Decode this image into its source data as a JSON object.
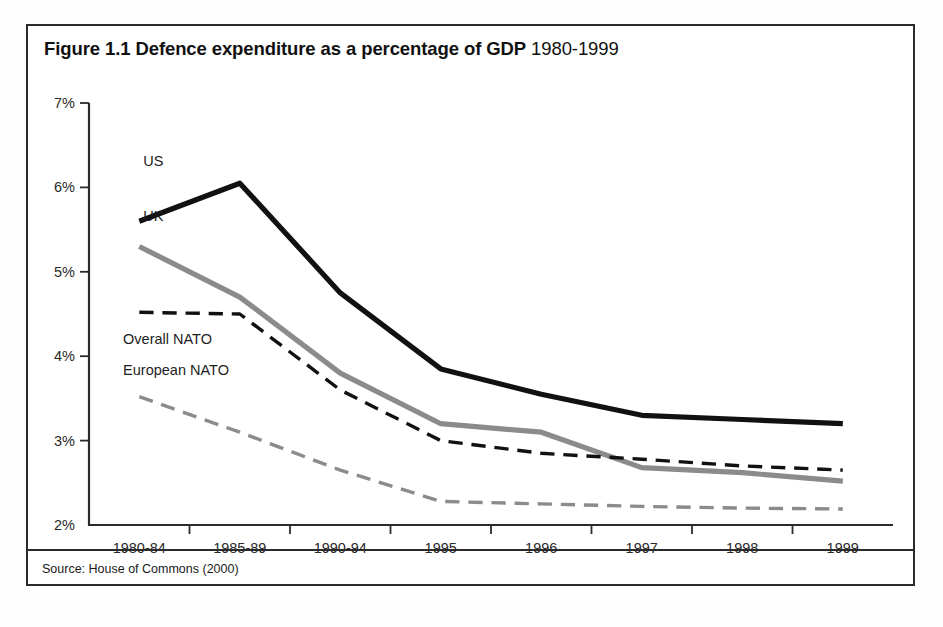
{
  "figure": {
    "title_bold": "Figure 1.1 Defence expenditure as a percentage of GDP",
    "title_regular": "1980-1999",
    "source": "Source: House of Commons (2000)"
  },
  "chart_data": {
    "type": "line",
    "title": "Figure 1.1 Defence expenditure as a percentage of GDP 1980-1999",
    "xlabel": "",
    "ylabel": "",
    "ylim": [
      2,
      7
    ],
    "ytick_values": [
      2,
      3,
      4,
      5,
      6,
      7
    ],
    "ytick_labels": [
      "2%",
      "3%",
      "4%",
      "5%",
      "6%",
      "7%"
    ],
    "grid": false,
    "legend_position": "inline-labels",
    "categories": [
      "1980-84",
      "1985-89",
      "1990-94",
      "1995",
      "1996",
      "1997",
      "1998",
      "1999"
    ],
    "series": [
      {
        "name": "US",
        "values": [
          5.6,
          6.05,
          4.75,
          3.85,
          3.55,
          3.3,
          3.25,
          3.2
        ],
        "color": "#111111",
        "style": "solid",
        "width": 5.2,
        "label_x": 1980.4,
        "label_y": 6.25
      },
      {
        "name": "UK",
        "values": [
          5.3,
          4.7,
          3.8,
          3.2,
          3.1,
          2.68,
          2.62,
          2.52
        ],
        "color": "#8b8b8b",
        "style": "solid",
        "width": 5.2,
        "label_x": 1980.4,
        "label_y": 5.6
      },
      {
        "name": "Overall NATO",
        "values": [
          4.52,
          4.5,
          3.6,
          3.0,
          2.85,
          2.78,
          2.7,
          2.65
        ],
        "color": "#111111",
        "style": "dashed",
        "width": 3.4,
        "label_x": 1980.2,
        "label_y": 4.15
      },
      {
        "name": "European NATO",
        "values": [
          3.52,
          3.1,
          2.65,
          2.28,
          2.25,
          2.22,
          2.2,
          2.19
        ],
        "color": "#8b8b8b",
        "style": "dashed",
        "width": 3.4,
        "label_x": 1980.2,
        "label_y": 3.78
      }
    ]
  },
  "colors": {
    "frame": "#2b2b2b",
    "axis": "#2b2b2b",
    "us_line": "#111111",
    "uk_line": "#8b8b8b",
    "overall_nato_line": "#111111",
    "european_nato_line": "#8b8b8b",
    "background": "#ffffff"
  }
}
